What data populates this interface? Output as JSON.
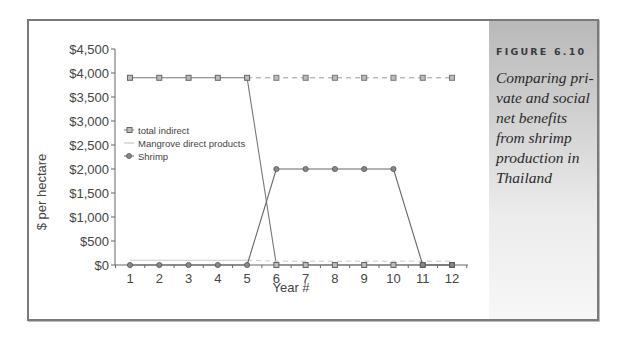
{
  "figure": {
    "label": "FIGURE 6.10",
    "caption": "Comparing private and social net benefits from shrimp production in Thailand",
    "caption_lines": [
      "Comparing pri-",
      "vate and social",
      "net benefits",
      "from shrimp",
      "production in",
      "Thailand"
    ]
  },
  "chart_data": {
    "type": "line",
    "title": "",
    "xlabel": "Year #",
    "ylabel": "$ per hectare",
    "x": [
      1,
      2,
      3,
      4,
      5,
      6,
      7,
      8,
      9,
      10,
      11,
      12
    ],
    "yticks": [
      "$0",
      "$500",
      "$1,000",
      "$1,500",
      "$2,000",
      "$2,500",
      "$3,000",
      "$3,500",
      "$4,000",
      "$4,500"
    ],
    "ylim": [
      0,
      4500
    ],
    "grid": false,
    "legend_position": "upper-left (inside plot)",
    "series": [
      {
        "name": "total indirect",
        "marker": "square",
        "values": [
          3900,
          3900,
          3900,
          3900,
          3900,
          0,
          0,
          0,
          0,
          0,
          0,
          0
        ],
        "dashed_continuation": {
          "x": [
            5,
            6,
            7,
            8,
            9,
            10,
            11,
            12
          ],
          "values": [
            3900,
            3900,
            3900,
            3900,
            3900,
            3900,
            3900,
            3900
          ]
        }
      },
      {
        "name": "Mangrove direct products",
        "marker": "none",
        "values": [
          100,
          100,
          100,
          100,
          100,
          0,
          0,
          0,
          0,
          0,
          0,
          0
        ],
        "dashed_continuation": {
          "x": [
            5,
            6,
            7,
            8,
            9,
            10,
            11,
            12
          ],
          "values": [
            100,
            80,
            80,
            80,
            80,
            80,
            80,
            80
          ]
        }
      },
      {
        "name": "Shrimp",
        "marker": "circle",
        "values": [
          0,
          0,
          0,
          0,
          0,
          2000,
          2000,
          2000,
          2000,
          2000,
          0,
          0
        ]
      }
    ]
  }
}
